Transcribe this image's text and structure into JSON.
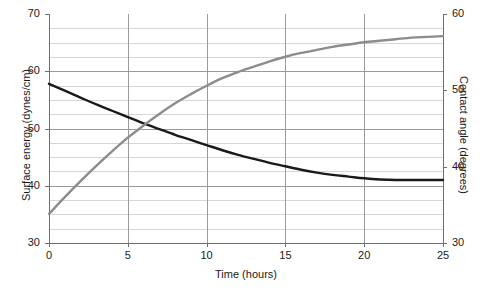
{
  "chart_data": {
    "type": "line",
    "title": "",
    "xlabel": "Time (hours)",
    "ylabel": "Surface energy (dynes/cm)",
    "ylabel_right": "Contact angle (degrees)",
    "xlim": [
      0,
      25
    ],
    "ylim": [
      30,
      70
    ],
    "ylim_right": [
      30,
      60
    ],
    "xticks": [
      "0",
      "5",
      "10",
      "15",
      "20",
      "25"
    ],
    "xtick_values": [
      0,
      5,
      10,
      15,
      20,
      25
    ],
    "yticks_left": [
      "70",
      "60",
      "50",
      "40",
      "30"
    ],
    "ytick_values_left": [
      70,
      60,
      50,
      40,
      30
    ],
    "yticks_right": [
      "60",
      "50",
      "40",
      "30"
    ],
    "ytick_values_right": [
      60,
      50,
      40,
      30
    ],
    "grid": true,
    "grid_minor_step_left": 2.5,
    "legend": "none",
    "series": [
      {
        "name": "Surface energy",
        "axis": "left",
        "color": "#1a1a1a",
        "width": 2.4,
        "x": [
          0,
          1,
          2,
          3,
          4,
          5,
          6,
          7,
          8,
          9,
          10,
          11,
          12,
          13,
          14,
          15,
          16,
          17,
          18,
          19,
          20,
          21,
          22,
          23,
          24,
          25
        ],
        "values": [
          57.8,
          56.6,
          55.4,
          54.2,
          53.1,
          52.0,
          50.9,
          49.9,
          48.9,
          48.0,
          47.1,
          46.2,
          45.4,
          44.7,
          44.0,
          43.4,
          42.8,
          42.3,
          41.9,
          41.6,
          41.3,
          41.1,
          41.0,
          41.0,
          41.0,
          41.0
        ]
      },
      {
        "name": "Contact angle",
        "axis": "right",
        "color": "#8c8c8c",
        "width": 2.4,
        "x": [
          0,
          1,
          2,
          3,
          4,
          5,
          6,
          7,
          8,
          9,
          10,
          11,
          12,
          13,
          14,
          15,
          16,
          17,
          18,
          19,
          20,
          21,
          22,
          23,
          24,
          25
        ],
        "values": [
          33.8,
          36.0,
          38.1,
          40.1,
          42.0,
          43.8,
          45.4,
          46.9,
          48.3,
          49.5,
          50.6,
          51.6,
          52.4,
          53.1,
          53.8,
          54.4,
          54.9,
          55.3,
          55.7,
          56.0,
          56.3,
          56.5,
          56.7,
          56.9,
          57.0,
          57.1
        ]
      }
    ],
    "crossing_point": {
      "x": 5.3,
      "y_left": 51.5,
      "y_right": 44.3
    }
  },
  "style": {
    "axis_color": "#6e6e6e",
    "grid_major_color": "#9a9a9a",
    "grid_minor_color": "#d7d7d7",
    "background": "#ffffff",
    "text_color": "#1a1a1a"
  }
}
